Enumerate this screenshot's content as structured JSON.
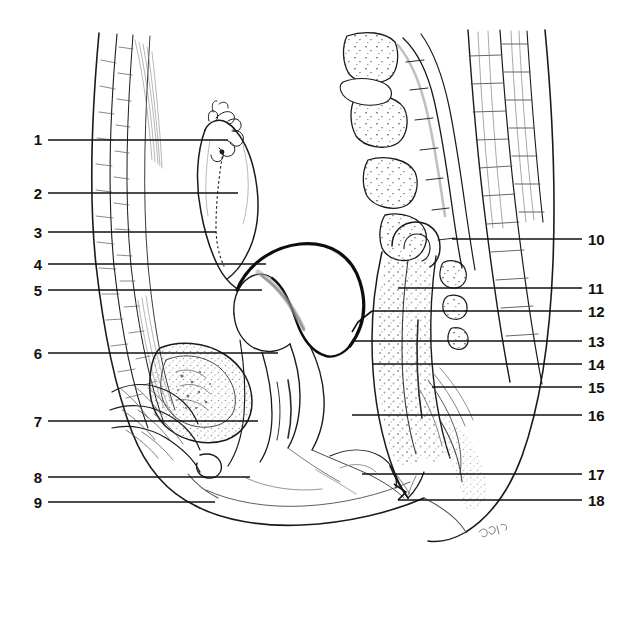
{
  "figure": {
    "orientation": "sagittal",
    "background_color": "#ffffff",
    "ink_color": "#1a1a1a",
    "shade_color": "#8a8a8a",
    "stipple_color": "#9a9a9a",
    "artist_signature": "signature-mark"
  },
  "labels": {
    "left": [
      {
        "id": "1",
        "text": "1",
        "num_x": 30,
        "num_y": 132,
        "line_x1": 48,
        "line_x2": 228,
        "line_y": 140
      },
      {
        "id": "2",
        "text": "2",
        "num_x": 30,
        "num_y": 186,
        "line_x1": 48,
        "line_x2": 238,
        "line_y": 193
      },
      {
        "id": "3",
        "text": "3",
        "num_x": 30,
        "num_y": 225,
        "line_x1": 48,
        "line_x2": 216,
        "line_y": 232
      },
      {
        "id": "4",
        "text": "4",
        "num_x": 30,
        "num_y": 257,
        "line_x1": 48,
        "line_x2": 266,
        "line_y": 264
      },
      {
        "id": "5",
        "text": "5",
        "num_x": 30,
        "num_y": 283,
        "line_x1": 48,
        "line_x2": 262,
        "line_y": 290
      },
      {
        "id": "6",
        "text": "6",
        "num_x": 30,
        "num_y": 346,
        "line_x1": 48,
        "line_x2": 278,
        "line_y": 353
      },
      {
        "id": "7",
        "text": "7",
        "num_x": 30,
        "num_y": 414,
        "line_x1": 48,
        "line_x2": 258,
        "line_y": 421
      },
      {
        "id": "8",
        "text": "8",
        "num_x": 30,
        "num_y": 470,
        "line_x1": 48,
        "line_x2": 250,
        "line_y": 477
      },
      {
        "id": "9",
        "text": "9",
        "num_x": 30,
        "num_y": 495,
        "line_x1": 48,
        "line_x2": 215,
        "line_y": 502
      }
    ],
    "right": [
      {
        "id": "10",
        "text": "10",
        "num_x": 590,
        "num_y": 232,
        "line_x1": 452,
        "line_x2": 582,
        "line_y": 239
      },
      {
        "id": "11",
        "text": "11",
        "num_x": 590,
        "num_y": 281,
        "line_x1": 398,
        "line_x2": 582,
        "line_y": 288
      },
      {
        "id": "12",
        "text": "12",
        "num_x": 590,
        "num_y": 304,
        "line_x1": 358,
        "line_x2": 582,
        "line_y": 311
      },
      {
        "id": "13",
        "text": "13",
        "num_x": 590,
        "num_y": 334,
        "line_x1": 352,
        "line_x2": 582,
        "line_y": 341
      },
      {
        "id": "14",
        "text": "14",
        "num_x": 590,
        "num_y": 357,
        "line_x1": 372,
        "line_x2": 582,
        "line_y": 364
      },
      {
        "id": "15",
        "text": "15",
        "num_x": 590,
        "num_y": 380,
        "line_x1": 432,
        "line_x2": 582,
        "line_y": 387
      },
      {
        "id": "16",
        "text": "16",
        "num_x": 590,
        "num_y": 408,
        "line_x1": 352,
        "line_x2": 582,
        "line_y": 415
      },
      {
        "id": "17",
        "text": "17",
        "num_x": 590,
        "num_y": 467,
        "line_x1": 362,
        "line_x2": 582,
        "line_y": 474
      },
      {
        "id": "18",
        "text": "18",
        "num_x": 590,
        "num_y": 493,
        "line_x1": 398,
        "line_x2": 582,
        "line_y": 500
      }
    ]
  },
  "leader_paths": {
    "bent_12": "M 358 311 L 372 330 L 352 341",
    "bent_18": "M 398 500 L 408 490 L 392 482"
  }
}
